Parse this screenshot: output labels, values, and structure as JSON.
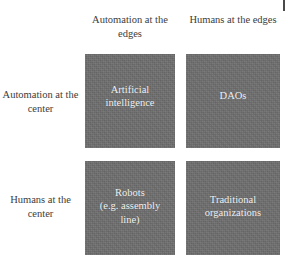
{
  "figure": {
    "type": "2x2-matrix",
    "background_color": "#ffffff",
    "cell_color": "#6e6e6e",
    "cell_text_color": "#f2f2f2",
    "header_text_color": "#3c3c3c"
  },
  "columns": [
    {
      "label": "Automation at\nthe edges"
    },
    {
      "label": "Humans at\nthe edges"
    }
  ],
  "rows": [
    {
      "label": "Automation at\nthe center"
    },
    {
      "label": "Humans at\nthe center"
    }
  ],
  "cells": [
    {
      "label": "Artificial\nintelligence"
    },
    {
      "label": "DAOs"
    },
    {
      "label": "Robots\n(e.g. assembly\nline)"
    },
    {
      "label": "Traditional\norganizations"
    }
  ]
}
